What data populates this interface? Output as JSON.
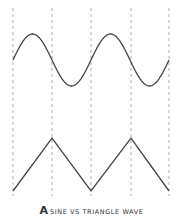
{
  "figure": {
    "panel_letter": "A",
    "caption": "SINE VS TRIANGLE WAVE"
  },
  "colors": {
    "wave": "#444444",
    "grid": "#999999",
    "background": "#ffffff"
  },
  "geometry": {
    "gridlines_x": [
      13,
      52,
      91,
      131,
      169
    ],
    "sine": {
      "x_start": 13,
      "x_end": 169,
      "center_y": 60,
      "amplitude": 26,
      "period_px": 78,
      "start_phase": "ascending-from-midline"
    },
    "triangle": {
      "points": [
        [
          13,
          191
        ],
        [
          52,
          138
        ],
        [
          91,
          191
        ],
        [
          131,
          138
        ],
        [
          169,
          191
        ]
      ]
    }
  }
}
